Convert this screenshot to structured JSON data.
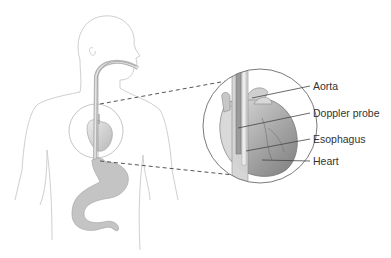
{
  "diagram": {
    "labels": [
      {
        "id": "aorta",
        "text": "Aorta"
      },
      {
        "id": "doppler-probe",
        "text": "Doppler probe"
      },
      {
        "id": "esophagus",
        "text": "Esophagus"
      },
      {
        "id": "heart",
        "text": "Heart"
      }
    ],
    "colors": {
      "outline": "#c8c8c8",
      "organ_fill": "#bdbdbd",
      "heart_dark": "#8a8a8a",
      "dashed_line": "#555555",
      "leader_line": "#444444",
      "label_text": "#333333"
    }
  }
}
